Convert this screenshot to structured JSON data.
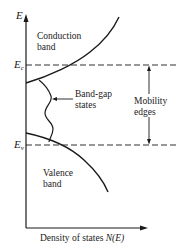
{
  "diagram": {
    "y_axis_label": "E",
    "x_axis_label_text": "Density of states ",
    "x_axis_label_math": "N(E)",
    "conduction_band_label_line1": "Conduction",
    "conduction_band_label_line2": "band",
    "valence_band_label_line1": "Valence",
    "valence_band_label_line2": "band",
    "band_gap_label_line1": "Band-gap",
    "band_gap_label_line2": "states",
    "mobility_label_line1": "Mobility",
    "mobility_label_line2": "edges",
    "ec_label_main": "E",
    "ec_label_sub": "c",
    "ev_label_main": "E",
    "ev_label_sub": "v",
    "line_color": "#1a1a1a"
  }
}
